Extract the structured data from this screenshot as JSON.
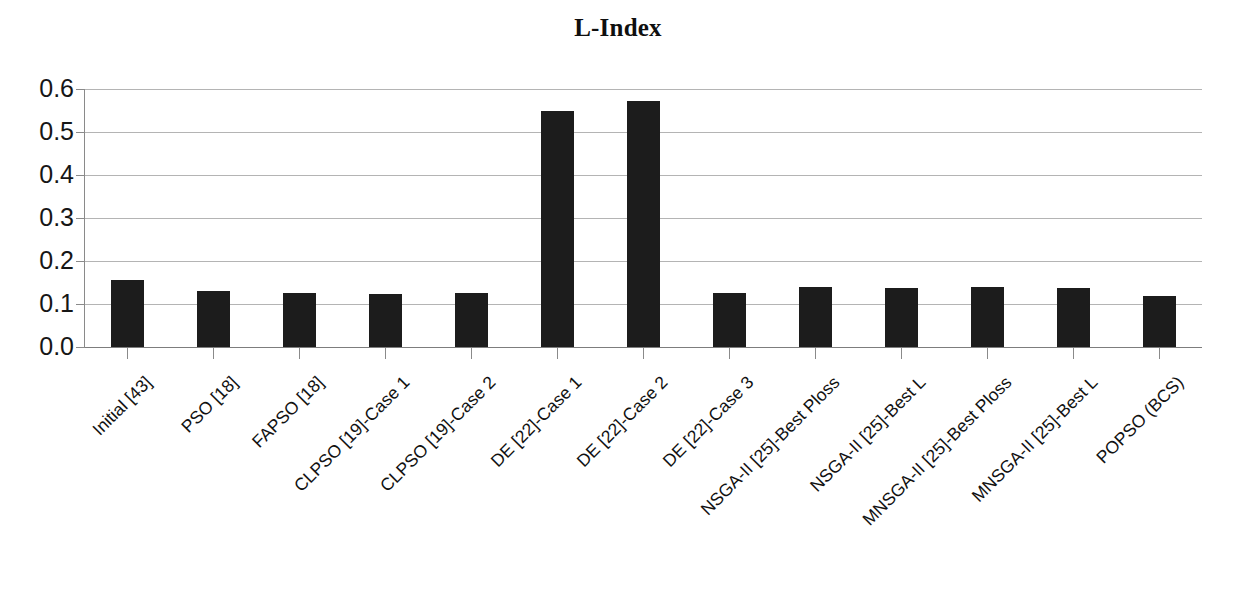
{
  "chart_data": {
    "type": "bar",
    "title": "L-Index",
    "xlabel": "",
    "ylabel": "",
    "ylim": [
      0.0,
      0.6
    ],
    "yticks": [
      "0.0",
      "0.1",
      "0.2",
      "0.3",
      "0.4",
      "0.5",
      "0.6"
    ],
    "ytick_values": [
      0.0,
      0.1,
      0.2,
      0.3,
      0.4,
      0.5,
      0.6
    ],
    "grid": true,
    "legend": false,
    "bar_color": "#1c1c1c",
    "categories": [
      "Initial [43]",
      "PSO [18]",
      "FAPSO [18]",
      "CLPSO [19]-Case 1",
      "CLPSO [19]-Case 2",
      "DE [22]-Case 1",
      "DE [22]-Case 2",
      "DE [22]-Case 3",
      "NSGA-II [25]-Best Ploss",
      "NSGA-II [25]-Best L",
      "MNSGA-II [25]-Best Ploss",
      "MNSGA-II [25]-Best L",
      "POPSO (BCS)"
    ],
    "values": [
      0.156,
      0.13,
      0.125,
      0.124,
      0.125,
      0.55,
      0.572,
      0.125,
      0.14,
      0.138,
      0.139,
      0.138,
      0.118
    ]
  }
}
